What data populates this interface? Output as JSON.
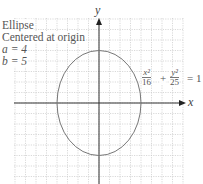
{
  "title_lines": [
    "Ellipse",
    "Centered at origin"
  ],
  "params": {
    "a_label": "a = 4",
    "b_label": "b = 5"
  },
  "equation": {
    "term1_num": "x²",
    "term1_den": "16",
    "plus": "+",
    "term2_num": "y²",
    "term2_den": "25",
    "equals": "= 1"
  },
  "axes": {
    "x_label": "x",
    "y_label": "y"
  },
  "graph": {
    "a": 4,
    "b": 5,
    "grid_unit_px": 10.5,
    "origin_px": [
      99,
      103
    ],
    "colors": {
      "grid": "#c8c8c8",
      "axis": "#333333",
      "curve": "#777777",
      "text": "#555555"
    }
  }
}
